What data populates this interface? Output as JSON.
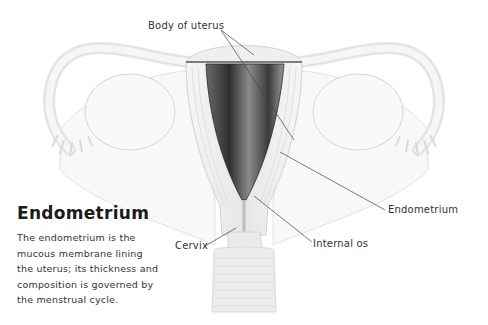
{
  "labels": {
    "body_of_uterus": "Body of uterus",
    "endometrium": "Endometrium",
    "internal_os": "Internal os",
    "cervix": "Cervix"
  },
  "info": {
    "title": "Endometrium",
    "lines": [
      "The endometrium is the",
      "mucous membrane lining",
      "the uterus; its thickness and",
      "composition is governed by",
      "the menstrual cycle."
    ]
  },
  "colors": {
    "background": "#ffffff",
    "tissue_light": "#ececec",
    "tissue_outline": "#cfcfcf",
    "cavity_dark": "#3a3a3a",
    "leader_line": "#444444",
    "text": "#333333"
  }
}
